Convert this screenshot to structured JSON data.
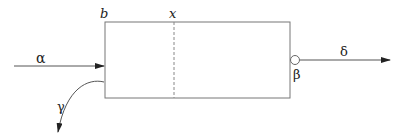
{
  "diagram": {
    "labels": {
      "b": "b",
      "x": "x",
      "alpha": "α",
      "beta": "β",
      "gamma": "γ",
      "delta": "δ"
    },
    "colors": {
      "stroke": "#555555",
      "text": "#222222",
      "background": "#ffffff"
    },
    "elements": {
      "box": "rectangle block",
      "divider": "dashed vertical line at x",
      "input_arrow": "α incoming arrow from left",
      "output_arrow": "δ outgoing arrow to right via port β",
      "branch_arrow": "γ curved arrow leaving bottom-left"
    }
  }
}
